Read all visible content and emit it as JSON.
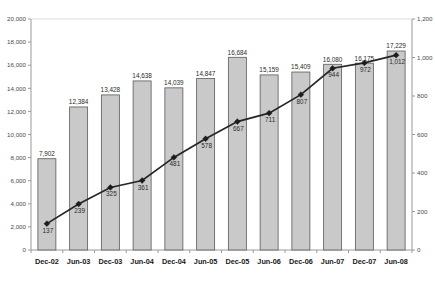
{
  "chart_data": {
    "type": "bar",
    "title": "",
    "subtitle": "",
    "xlabel": "",
    "ylabel": "",
    "grid": false,
    "legend": "none",
    "categories": [
      "Dec-02",
      "Jun-03",
      "Dec-03",
      "Jun-04",
      "Dec-04",
      "Jun-05",
      "Dec-05",
      "Jun-06",
      "Dec-06",
      "Jun-07",
      "Dec-07",
      "Jun-08"
    ],
    "series": [
      {
        "name": "bars",
        "type": "bar",
        "axis": "left",
        "values": [
          7902,
          12384,
          13428,
          14638,
          14039,
          14847,
          16684,
          15159,
          15409,
          16080,
          16175,
          17229
        ],
        "labels": [
          "7,902",
          "12,384",
          "13,428",
          "14,638",
          "14,039",
          "14,847",
          "16,684",
          "15,159",
          "15,409",
          "16,080",
          "16,175",
          "17,229"
        ],
        "color": "#c9c9c9"
      },
      {
        "name": "line",
        "type": "line",
        "axis": "right",
        "values": [
          137,
          239,
          325,
          361,
          481,
          578,
          667,
          711,
          807,
          944,
          972,
          1012
        ],
        "labels": [
          "137",
          "239",
          "325",
          "361",
          "481",
          "578",
          "667",
          "711",
          "807",
          "944",
          "972",
          "1,012"
        ],
        "color": "#262626",
        "marker": "diamond"
      }
    ],
    "left_axis": {
      "min": 0,
      "max": 20000,
      "step": 2000,
      "ticks": [
        "0",
        "2,000",
        "4,000",
        "6,000",
        "8,000",
        "10,000",
        "12,000",
        "14,000",
        "16,000",
        "18,000",
        "20,000"
      ]
    },
    "right_axis": {
      "min": 0,
      "max": 1200,
      "step": 200,
      "ticks": [
        "0",
        "200",
        "400",
        "600",
        "800",
        "1,000",
        "1,200"
      ]
    }
  }
}
